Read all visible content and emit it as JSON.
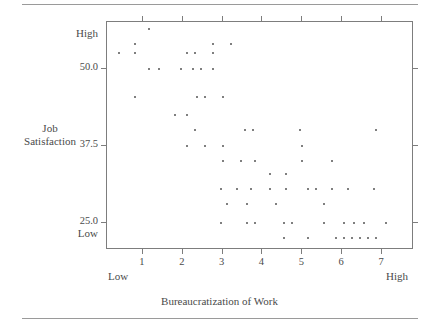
{
  "chart_data": {
    "type": "scatter",
    "title": "",
    "xlabel": "Bureaucratization of Work",
    "ylabel": "Job Satisfaction",
    "ylabel_lines": [
      "Job",
      "Satisfaction"
    ],
    "grid": false,
    "legend": null,
    "xlim": [
      0.1,
      7.8
    ],
    "ylim": [
      20.6,
      57.6
    ],
    "xticks": [
      1,
      2,
      3,
      4,
      5,
      6,
      7
    ],
    "xticklabels": [
      "1",
      "2",
      "3",
      "4",
      "5",
      "6",
      "7"
    ],
    "yticks": [
      50.0,
      37.5,
      25.0
    ],
    "yticklabels": [
      "50.0",
      "37.5",
      "25.0"
    ],
    "x_axis_end_labels": {
      "low": "Low",
      "high": "High"
    },
    "y_axis_end_labels": {
      "low": "Low",
      "high": "High"
    },
    "point_color": "#555555",
    "frame_color": "#7d7d7d",
    "rule_color": "#9a9a9a",
    "n_points": 95,
    "points": [
      [
        1.15,
        56.5
      ],
      [
        0.8,
        54.0
      ],
      [
        2.75,
        54.0
      ],
      [
        3.2,
        54.0
      ],
      [
        0.4,
        52.5
      ],
      [
        0.8,
        52.5
      ],
      [
        2.1,
        52.5
      ],
      [
        2.3,
        52.5
      ],
      [
        2.75,
        52.5
      ],
      [
        1.15,
        50.0
      ],
      [
        1.4,
        50.0
      ],
      [
        1.95,
        50.0
      ],
      [
        2.25,
        50.0
      ],
      [
        2.45,
        50.0
      ],
      [
        2.75,
        50.0
      ],
      [
        0.8,
        45.5
      ],
      [
        2.35,
        45.5
      ],
      [
        2.55,
        45.5
      ],
      [
        3.0,
        45.5
      ],
      [
        1.8,
        42.5
      ],
      [
        2.1,
        42.5
      ],
      [
        2.3,
        40.0
      ],
      [
        3.55,
        40.0
      ],
      [
        3.75,
        40.0
      ],
      [
        4.95,
        40.0
      ],
      [
        6.85,
        40.0
      ],
      [
        2.1,
        37.5
      ],
      [
        2.55,
        37.5
      ],
      [
        3.0,
        37.5
      ],
      [
        5.0,
        37.5
      ],
      [
        3.0,
        35.0
      ],
      [
        3.45,
        35.0
      ],
      [
        3.8,
        35.0
      ],
      [
        5.0,
        35.0
      ],
      [
        5.75,
        35.0
      ],
      [
        4.2,
        33.0
      ],
      [
        4.6,
        33.0
      ],
      [
        2.95,
        30.5
      ],
      [
        3.35,
        30.5
      ],
      [
        3.7,
        30.5
      ],
      [
        4.2,
        30.5
      ],
      [
        4.6,
        30.5
      ],
      [
        5.15,
        30.5
      ],
      [
        5.35,
        30.5
      ],
      [
        5.75,
        30.5
      ],
      [
        6.15,
        30.5
      ],
      [
        6.8,
        30.5
      ],
      [
        3.1,
        28.0
      ],
      [
        3.6,
        28.0
      ],
      [
        4.35,
        28.0
      ],
      [
        5.55,
        28.0
      ],
      [
        2.95,
        25.0
      ],
      [
        3.6,
        25.0
      ],
      [
        3.8,
        25.0
      ],
      [
        4.55,
        25.0
      ],
      [
        4.75,
        25.0
      ],
      [
        5.55,
        25.0
      ],
      [
        6.05,
        25.0
      ],
      [
        6.3,
        25.0
      ],
      [
        6.55,
        25.0
      ],
      [
        7.1,
        25.0
      ],
      [
        4.55,
        22.5
      ],
      [
        5.15,
        22.5
      ],
      [
        5.85,
        22.5
      ],
      [
        6.05,
        22.5
      ],
      [
        6.25,
        22.5
      ],
      [
        6.45,
        22.5
      ],
      [
        6.65,
        22.5
      ],
      [
        6.85,
        22.5
      ]
    ]
  },
  "figure": {
    "has_top_rule": true,
    "has_bottom_rule": true
  }
}
